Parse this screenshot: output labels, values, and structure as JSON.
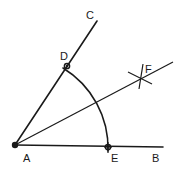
{
  "diagram": {
    "title_fragment": "",
    "points": {
      "A": {
        "label": "A",
        "x": 15,
        "y": 145
      },
      "B": {
        "label": "B",
        "x": 163,
        "y": 147
      },
      "C": {
        "label": "C",
        "x": 97,
        "y": 21
      },
      "D": {
        "label": "D",
        "x": 67,
        "y": 66
      },
      "E": {
        "label": "E",
        "x": 108,
        "y": 147
      },
      "F": {
        "label": "F",
        "x": 141,
        "y": 79
      }
    },
    "segments": [
      {
        "name": "ray-AB",
        "from": "A",
        "to": "B"
      },
      {
        "name": "ray-AC",
        "from": "A",
        "to": "C"
      },
      {
        "name": "bisector-AF",
        "from": "A",
        "to": "F",
        "extends_to": [
          173,
          62
        ]
      }
    ],
    "arcs": [
      {
        "name": "arc-DE",
        "center": "A",
        "from": "D",
        "to": "E"
      },
      {
        "name": "arc-mark-F1",
        "center": "D"
      },
      {
        "name": "arc-mark-F2",
        "center": "E"
      }
    ],
    "colors": {
      "stroke": "#1a1a1a",
      "background": "#ffffff"
    }
  }
}
